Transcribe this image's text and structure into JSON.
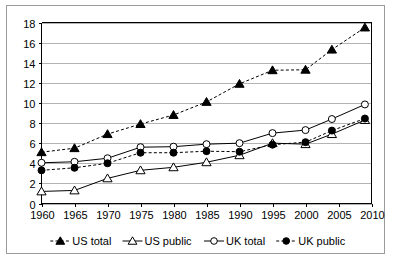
{
  "chart_data": {
    "type": "line",
    "title": "",
    "xlabel": "",
    "ylabel": "",
    "x": [
      1960,
      1965,
      1970,
      1975,
      1980,
      1985,
      1990,
      1995,
      2000,
      2004,
      2009
    ],
    "xlim": [
      1960,
      2010
    ],
    "ylim": [
      0,
      18
    ],
    "x_ticks": [
      "1960",
      "1965",
      "1970",
      "1975",
      "1980",
      "1985",
      "1990",
      "1995",
      "2000",
      "2005",
      "2010"
    ],
    "x_tick_values": [
      1960,
      1965,
      1970,
      1975,
      1980,
      1985,
      1990,
      1995,
      2000,
      2005,
      2010
    ],
    "y_ticks": [
      "0",
      "2",
      "4",
      "6",
      "8",
      "10",
      "12",
      "14",
      "16",
      "18"
    ],
    "y_tick_values": [
      0,
      2,
      4,
      6,
      8,
      10,
      12,
      14,
      16,
      18
    ],
    "grid": true,
    "legend_position": "bottom",
    "series": [
      {
        "name": "US total",
        "marker": "triangle-filled",
        "line_style": "dashed",
        "values": [
          5.1,
          5.5,
          6.9,
          7.9,
          8.8,
          10.1,
          11.9,
          13.25,
          13.3,
          15.3,
          17.5
        ]
      },
      {
        "name": "US public",
        "marker": "triangle-open",
        "line_style": "solid",
        "values": [
          1.2,
          1.3,
          2.5,
          3.3,
          3.6,
          4.1,
          4.8,
          6.0,
          5.9,
          6.9,
          8.3
        ]
      },
      {
        "name": "UK total",
        "marker": "circle-open",
        "line_style": "solid",
        "values": [
          4.05,
          4.15,
          4.5,
          5.6,
          5.65,
          5.9,
          6.0,
          7.0,
          7.3,
          8.4,
          9.85
        ]
      },
      {
        "name": "UK public",
        "marker": "circle-filled",
        "line_style": "dashed",
        "values": [
          3.3,
          3.55,
          4.0,
          5.05,
          5.05,
          5.2,
          5.15,
          5.85,
          6.1,
          7.25,
          8.45
        ]
      }
    ]
  },
  "legend": {
    "items": [
      {
        "label": "US total"
      },
      {
        "label": "US public"
      },
      {
        "label": "UK total"
      },
      {
        "label": "UK public"
      }
    ]
  }
}
